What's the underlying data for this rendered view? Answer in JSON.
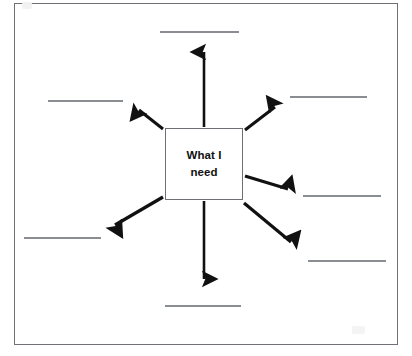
{
  "worksheet": {
    "title": "What I need radial diagram worksheet",
    "frame_color": "#6f7276",
    "line_color": "#8a8d91",
    "arrow_color": "#111111",
    "background": "#ffffff"
  },
  "center": {
    "label_line1": "What I",
    "label_line2": "need",
    "full_label": "What I need",
    "border_color": "#6c6f73"
  },
  "blanks": [
    {
      "id": "blank-top",
      "position": "top",
      "value": "",
      "x": 160,
      "y": 31,
      "width": 79
    },
    {
      "id": "blank-top-left",
      "position": "top-left",
      "value": "",
      "x": 48,
      "y": 100,
      "width": 75
    },
    {
      "id": "blank-top-right",
      "position": "top-right",
      "value": "",
      "x": 290,
      "y": 96,
      "width": 77
    },
    {
      "id": "blank-right",
      "position": "right",
      "value": "",
      "x": 303,
      "y": 195,
      "width": 78
    },
    {
      "id": "blank-bottom-right",
      "position": "bottom-right",
      "value": "",
      "x": 308,
      "y": 260,
      "width": 78
    },
    {
      "id": "blank-bottom",
      "position": "bottom",
      "value": "",
      "x": 165,
      "y": 305,
      "width": 76
    },
    {
      "id": "blank-bottom-left",
      "position": "bottom-left",
      "value": "",
      "x": 24,
      "y": 237,
      "width": 77
    },
    {
      "id": "blank-left",
      "position": "left",
      "value": "",
      "x": 48,
      "y": 100,
      "width": 75
    }
  ],
  "arrows": [
    {
      "id": "arrow-up",
      "direction": "up",
      "from_x": 204,
      "from_y": 127,
      "to_x": 204,
      "to_y": 47
    },
    {
      "id": "arrow-up-left",
      "direction": "up-left",
      "from_x": 163,
      "from_y": 129,
      "to_x": 133,
      "to_y": 105
    },
    {
      "id": "arrow-up-right",
      "direction": "up-right",
      "from_x": 245,
      "from_y": 130,
      "to_x": 280,
      "to_y": 102
    },
    {
      "id": "arrow-right",
      "direction": "right",
      "from_x": 245,
      "from_y": 176,
      "to_x": 294,
      "to_y": 191
    },
    {
      "id": "arrow-down-right",
      "direction": "down-right",
      "from_x": 244,
      "from_y": 203,
      "to_x": 298,
      "to_y": 248
    },
    {
      "id": "arrow-down",
      "direction": "down",
      "from_x": 204,
      "from_y": 201,
      "to_x": 204,
      "to_y": 285
    },
    {
      "id": "arrow-down-left",
      "direction": "down-left",
      "from_x": 163,
      "from_y": 197,
      "to_x": 108,
      "to_y": 229
    }
  ]
}
